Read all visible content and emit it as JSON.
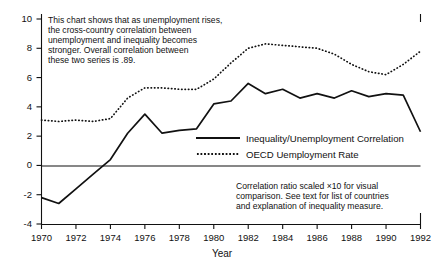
{
  "chart_data": {
    "type": "line",
    "title": "",
    "xlabel": "Year",
    "ylabel": "",
    "xlim": [
      1970,
      1992
    ],
    "ylim": [
      -4,
      10
    ],
    "grid": false,
    "zero_line": true,
    "legend_position": "center-right",
    "x": [
      1970,
      1971,
      1972,
      1973,
      1974,
      1975,
      1976,
      1977,
      1978,
      1979,
      1980,
      1981,
      1982,
      1983,
      1984,
      1985,
      1986,
      1987,
      1988,
      1989,
      1990,
      1991,
      1992
    ],
    "xticks": [
      "1970",
      "1972",
      "1974",
      "1976",
      "1978",
      "1980",
      "1982",
      "1984",
      "1986",
      "1988",
      "1990",
      "1992"
    ],
    "yticks": [
      "10",
      "8",
      "6",
      "4",
      "2",
      "0",
      "-2",
      "-4"
    ],
    "series": [
      {
        "name": "Inequality/Unemployment Correlation",
        "style": "solid",
        "color": "#111111",
        "values": [
          -2.2,
          -2.6,
          -1.6,
          -0.6,
          0.4,
          2.2,
          3.5,
          2.2,
          2.4,
          2.5,
          4.2,
          4.4,
          5.6,
          4.9,
          5.2,
          4.6,
          4.9,
          4.6,
          5.1,
          4.7,
          4.9,
          4.8,
          2.3
        ]
      },
      {
        "name": "OECD Uemployment Rate",
        "style": "dotted",
        "color": "#111111",
        "values": [
          3.1,
          3.0,
          3.1,
          3.0,
          3.2,
          4.6,
          5.3,
          5.3,
          5.2,
          5.2,
          5.9,
          7.0,
          8.0,
          8.3,
          8.2,
          8.1,
          8.0,
          7.6,
          6.9,
          6.4,
          6.2,
          6.9,
          7.8
        ]
      }
    ],
    "annotations": [
      {
        "name": "top-left-note",
        "lines": [
          "This chart shows that as unemployment rises,",
          "the cross-country correlation between",
          "unemployment and inequality becomes",
          "stronger. Overall correlation between",
          "these two series is .89."
        ]
      },
      {
        "name": "bottom-right-note",
        "lines": [
          "Correlation ratio scaled ×10 for visual",
          "comparison. See text for list of countries",
          "and explanation of inequality measure."
        ]
      }
    ]
  }
}
